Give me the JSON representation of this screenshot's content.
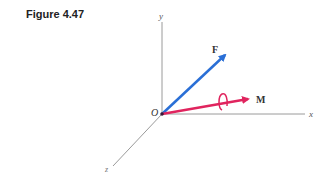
{
  "figure": {
    "label": "Figure 4.47"
  },
  "axes": {
    "x": "x",
    "y": "y",
    "z": "z",
    "origin": "O"
  },
  "vectors": {
    "force": {
      "label": "F",
      "color": "#2a6fd6"
    },
    "moment": {
      "label": "M",
      "color": "#e0245e"
    }
  },
  "colors": {
    "axis": "#9a9a9a",
    "text": "#333333"
  }
}
